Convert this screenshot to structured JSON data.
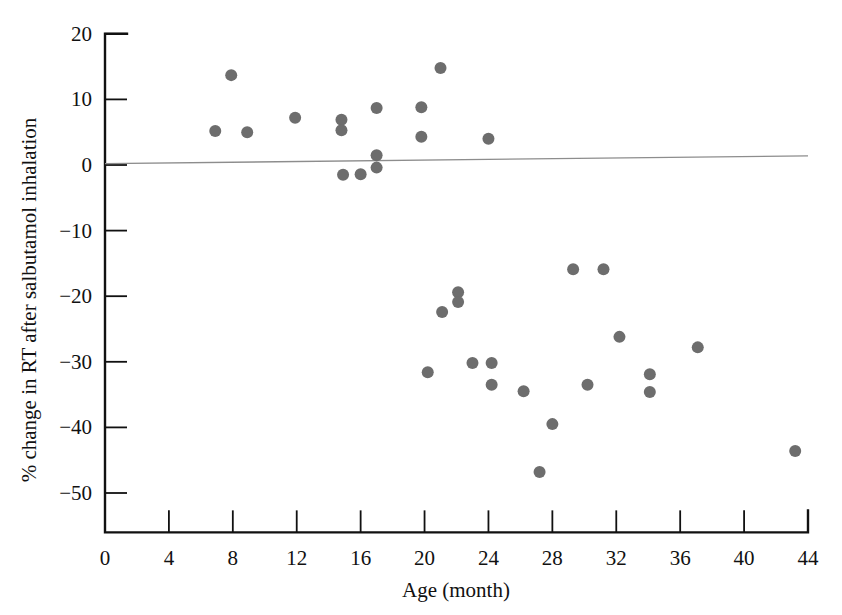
{
  "figure": {
    "background": "#ffffff",
    "point_color": "#6d6d6d",
    "axis_color": "#111111",
    "trend_color": "#8d8d8d"
  },
  "chart_data": {
    "type": "scatter",
    "title": "",
    "xlabel": "Age (month)",
    "ylabel": "% change in RT after salbutamol inhalation",
    "xlim": [
      0,
      44
    ],
    "ylim": [
      -56,
      20
    ],
    "xticks": [
      0,
      4,
      8,
      12,
      16,
      20,
      24,
      28,
      32,
      36,
      40,
      44
    ],
    "yticks": [
      20,
      10,
      0,
      -10,
      -20,
      -30,
      -40,
      -50
    ],
    "xtick_labels": [
      "0",
      "4",
      "8",
      "12",
      "16",
      "20",
      "24",
      "28",
      "32",
      "36",
      "40",
      "44"
    ],
    "ytick_labels": [
      "20",
      "10",
      "0",
      "−10",
      "−20",
      "−30",
      "−40",
      "−50"
    ],
    "grid": false,
    "legend": null,
    "marker": "circle",
    "marker_size": 6,
    "points": [
      {
        "x": 6.9,
        "y": 5.2
      },
      {
        "x": 7.9,
        "y": 13.7
      },
      {
        "x": 8.9,
        "y": 5.0
      },
      {
        "x": 11.9,
        "y": 7.2
      },
      {
        "x": 14.8,
        "y": 6.9
      },
      {
        "x": 14.8,
        "y": 5.3
      },
      {
        "x": 14.9,
        "y": -1.5
      },
      {
        "x": 16.0,
        "y": -1.4
      },
      {
        "x": 17.0,
        "y": 8.7
      },
      {
        "x": 17.0,
        "y": 1.5
      },
      {
        "x": 17.0,
        "y": -0.4
      },
      {
        "x": 19.8,
        "y": 8.8
      },
      {
        "x": 19.8,
        "y": 4.3
      },
      {
        "x": 21.0,
        "y": 14.8
      },
      {
        "x": 24.0,
        "y": 4.0
      },
      {
        "x": 20.2,
        "y": -31.6
      },
      {
        "x": 21.1,
        "y": -22.4
      },
      {
        "x": 22.1,
        "y": -19.4
      },
      {
        "x": 22.1,
        "y": -20.9
      },
      {
        "x": 23.0,
        "y": -30.2
      },
      {
        "x": 24.2,
        "y": -30.2
      },
      {
        "x": 24.2,
        "y": -33.5
      },
      {
        "x": 26.2,
        "y": -34.5
      },
      {
        "x": 27.2,
        "y": -46.8
      },
      {
        "x": 28.0,
        "y": -39.5
      },
      {
        "x": 29.3,
        "y": -15.9
      },
      {
        "x": 30.2,
        "y": -33.5
      },
      {
        "x": 31.2,
        "y": -15.9
      },
      {
        "x": 32.2,
        "y": -26.2
      },
      {
        "x": 34.1,
        "y": -31.9
      },
      {
        "x": 34.1,
        "y": -34.6
      },
      {
        "x": 37.1,
        "y": -27.8
      },
      {
        "x": 43.2,
        "y": -43.6
      }
    ],
    "trendline": {
      "label": "regression line",
      "x_start": 0,
      "y_start": 0.2,
      "x_end": 44,
      "y_end": 1.4
    }
  }
}
